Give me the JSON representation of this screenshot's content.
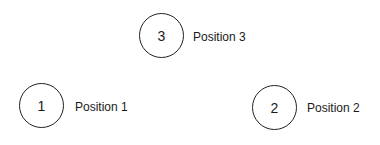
{
  "diagram": {
    "nodes": [
      {
        "number": "1",
        "label": "Position 1"
      },
      {
        "number": "2",
        "label": "Position 2"
      },
      {
        "number": "3",
        "label": "Position 3"
      }
    ]
  }
}
